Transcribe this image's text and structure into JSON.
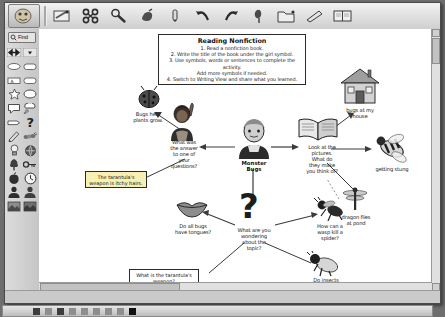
{
  "window": {
    "title": "Kidspiration Symbol View"
  },
  "toolbar": {
    "logo_icon": "app-logo-icon",
    "buttons": [
      {
        "name": "new-symbol-button",
        "icon": "symbol-box-icon"
      },
      {
        "name": "link-button",
        "icon": "link-icon"
      },
      {
        "name": "zoom-button",
        "icon": "magnifier-icon"
      },
      {
        "name": "clear-button",
        "icon": "eraser-icon"
      },
      {
        "name": "pen-button",
        "icon": "pen-icon"
      },
      {
        "name": "undo-button",
        "icon": "undo-arrow-icon"
      },
      {
        "name": "redo-button",
        "icon": "redo-arrow-icon"
      },
      {
        "name": "paint-button",
        "icon": "paintbrush-icon"
      },
      {
        "name": "folder-button",
        "icon": "folder-icon"
      },
      {
        "name": "highlight-button",
        "icon": "highlighter-icon"
      },
      {
        "name": "writing-view-button",
        "icon": "book-view-icon"
      }
    ]
  },
  "palette": {
    "find_label": "Find",
    "find_icon": "find-icon",
    "items": [
      {
        "name": "palette-arrows",
        "icon": "left-right-arrows-icon"
      },
      {
        "name": "palette-dropdown",
        "icon": "chevron-down-icon"
      },
      {
        "name": "palette-oval-1",
        "icon": "oval-shape-icon"
      },
      {
        "name": "palette-rounded-1",
        "icon": "rounded-rect-icon"
      },
      {
        "name": "palette-text-box",
        "icon": "text-box-icon"
      },
      {
        "name": "palette-rounded-2",
        "icon": "rounded-rect-icon"
      },
      {
        "name": "palette-star",
        "icon": "star-icon"
      },
      {
        "name": "palette-ellipse",
        "icon": "ellipse-icon"
      },
      {
        "name": "palette-speech-bubble",
        "icon": "speech-bubble-icon"
      },
      {
        "name": "palette-thought-bubble",
        "icon": "thought-bubble-icon"
      },
      {
        "name": "palette-flag",
        "icon": "flag-icon"
      },
      {
        "name": "palette-question-mark",
        "icon": "question-mark-icon"
      },
      {
        "name": "palette-pencil",
        "icon": "pencil-icon"
      },
      {
        "name": "palette-caterpillar",
        "icon": "caterpillar-icon"
      },
      {
        "name": "palette-lightbulb",
        "icon": "lightbulb-icon"
      },
      {
        "name": "palette-globe",
        "icon": "globe-icon"
      },
      {
        "name": "palette-tree",
        "icon": "tree-icon"
      },
      {
        "name": "palette-key",
        "icon": "key-icon"
      },
      {
        "name": "palette-apple",
        "icon": "apple-icon"
      },
      {
        "name": "palette-clock",
        "icon": "clock-icon"
      },
      {
        "name": "palette-person-1",
        "icon": "person-icon"
      },
      {
        "name": "palette-person-2",
        "icon": "person-icon"
      },
      {
        "name": "palette-photo-1",
        "icon": "photo-icon"
      },
      {
        "name": "palette-photo-2",
        "icon": "photo-icon"
      }
    ]
  },
  "canvas": {
    "instructions": {
      "title": "Reading Nonfiction",
      "lines": [
        "1. Read a nonfiction book.",
        "2. Write the title of the book under the girl symbol.",
        "3. Use symbols, words or sentences to complete the activity.",
        "Add more symbols if needed.",
        "4. Switch to Writing View and share what you learned."
      ]
    },
    "center": {
      "label": "Monster\nBugs",
      "icon": "girl-symbol-icon"
    },
    "nodes": [
      {
        "name": "node-ladybug",
        "icon": "ladybug-icon",
        "label": "Bugs help\nplants grow."
      },
      {
        "name": "node-question-raised-hand",
        "icon": "child-raised-hand-icon",
        "label": "What was\nthe answer\nto one of\nyour\nquestions?"
      },
      {
        "name": "node-open-book",
        "icon": "open-book-icon",
        "label": "Look at the\npictures.\nWhat do\nthey make\nyou think of?"
      },
      {
        "name": "node-house",
        "icon": "house-icon",
        "label": "bugs at my\nhouse"
      },
      {
        "name": "node-bee",
        "icon": "bee-icon",
        "label": "getting stung"
      },
      {
        "name": "node-dragonfly",
        "icon": "dragonfly-icon",
        "label": "dragon flies\nat pond"
      },
      {
        "name": "node-wasp",
        "icon": "wasp-icon",
        "label": "How can a\nwasp kill a\nspider?"
      },
      {
        "name": "node-fly",
        "icon": "fly-icon",
        "label": "Do insects\nhelp us?"
      },
      {
        "name": "node-lips",
        "icon": "lips-icon",
        "label": "Do all bugs\nhave tongues?"
      },
      {
        "name": "node-question-mark",
        "icon": "question-mark-icon",
        "label": "What are you\nwondering\nabout the\ntopic?"
      }
    ],
    "notes": [
      {
        "name": "note-tarantula-answer",
        "text": "The tarantula's\nweapon is itchy hairs.",
        "color": "#f7efb4"
      },
      {
        "name": "note-tarantula-question",
        "text": "What is the tarantula's\nweapon?",
        "color": "#ffffff"
      }
    ]
  },
  "dock": {
    "items": [
      "dock-item-1",
      "dock-item-2",
      "dock-item-3",
      "dock-item-4",
      "dock-item-5",
      "dock-item-6",
      "dock-item-7",
      "dock-item-8",
      "dock-item-9"
    ]
  }
}
